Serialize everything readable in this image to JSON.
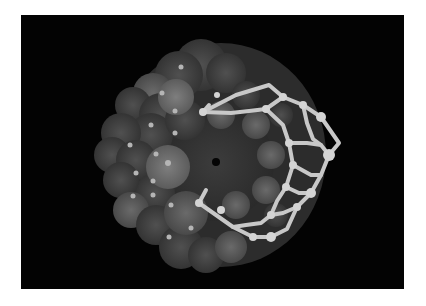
{
  "figure": {
    "background": "#030303",
    "frame_color": "#ffffff",
    "sphere_palette": [
      "#3a3a3a",
      "#454545",
      "#525252",
      "#606060",
      "#6e6e6e"
    ],
    "lattice_color": "#c8c8c8",
    "highlight_color": "#b5b5b5"
  }
}
